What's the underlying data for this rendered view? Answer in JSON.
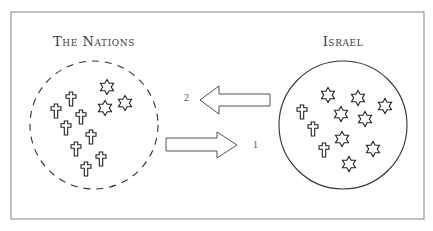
{
  "diagram": {
    "frame": {
      "x": 11,
      "y": 12,
      "w": 413,
      "h": 207,
      "stroke": "#9a9a9a"
    },
    "groups": [
      {
        "id": "nations",
        "title": "The Nations",
        "title_pos": {
          "x": 94,
          "y": 43
        },
        "circle": {
          "cx": 94,
          "cy": 125,
          "r": 64,
          "style": "dashed"
        },
        "symbols": [
          {
            "type": "star",
            "x": 107,
            "y": 87
          },
          {
            "type": "star",
            "x": 105,
            "y": 108
          },
          {
            "type": "star",
            "x": 125,
            "y": 103
          },
          {
            "type": "cross",
            "x": 71,
            "y": 99
          },
          {
            "type": "cross",
            "x": 56,
            "y": 111
          },
          {
            "type": "cross",
            "x": 81,
            "y": 117
          },
          {
            "type": "cross",
            "x": 66,
            "y": 128
          },
          {
            "type": "cross",
            "x": 91,
            "y": 137
          },
          {
            "type": "cross",
            "x": 76,
            "y": 149
          },
          {
            "type": "cross",
            "x": 101,
            "y": 159
          },
          {
            "type": "cross",
            "x": 86,
            "y": 169
          }
        ]
      },
      {
        "id": "israel",
        "title": "Israel",
        "title_pos": {
          "x": 343,
          "y": 43
        },
        "circle": {
          "cx": 343,
          "cy": 125,
          "r": 64,
          "style": "solid"
        },
        "symbols": [
          {
            "type": "star",
            "x": 328,
            "y": 95
          },
          {
            "type": "star",
            "x": 358,
            "y": 98
          },
          {
            "type": "star",
            "x": 385,
            "y": 106
          },
          {
            "type": "star",
            "x": 341,
            "y": 114
          },
          {
            "type": "star",
            "x": 365,
            "y": 119
          },
          {
            "type": "star",
            "x": 342,
            "y": 139
          },
          {
            "type": "star",
            "x": 373,
            "y": 149
          },
          {
            "type": "star",
            "x": 349,
            "y": 164
          },
          {
            "type": "cross",
            "x": 302,
            "y": 112
          },
          {
            "type": "cross",
            "x": 313,
            "y": 129
          },
          {
            "type": "cross",
            "x": 324,
            "y": 150
          }
        ]
      }
    ],
    "arrows": [
      {
        "label": "2",
        "direction": "left",
        "label_pos": {
          "x": 187,
          "y": 99
        },
        "points": "270,94 219,94 219,86 200,100 219,114 219,106 270,106"
      },
      {
        "label": "1",
        "direction": "right",
        "label_pos": {
          "x": 256,
          "y": 146
        },
        "points": "166,138 217,138 217,132 237,145 217,158 217,151 166,151"
      }
    ],
    "colors": {
      "ink": "#333333",
      "frame": "#9a9a9a",
      "background": "#ffffff"
    }
  }
}
